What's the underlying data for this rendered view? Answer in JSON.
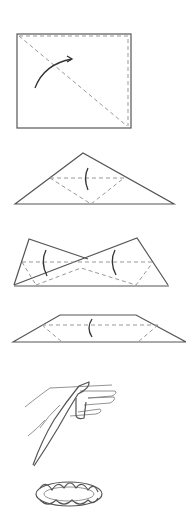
{
  "diagram": {
    "type": "folding-instructions",
    "steps": [
      {
        "index": 1,
        "name": "square-sheet",
        "description": "Square sheet with a diagonal fold line and an arrow showing the fold along it"
      },
      {
        "index": 2,
        "name": "triangle",
        "description": "Folded triangle with dashed fold lines and a curved arrow"
      },
      {
        "index": 3,
        "name": "crossed-folds",
        "description": "Corners folded inward and crossing, dashed fold lines, two curved arrows"
      },
      {
        "index": 4,
        "name": "trapezoid-band",
        "description": "Folded into a long band/trapezoid with dashed fold line and curved arrow"
      },
      {
        "index": 5,
        "name": "hand-wrap",
        "description": "Band being wrapped around the fingers of a hand"
      },
      {
        "index": 6,
        "name": "twisted-ring",
        "description": "Finished twisted ring shape"
      }
    ]
  },
  "colors": {
    "line": "#555555",
    "dashed": "#999999",
    "arrow": "#333333",
    "background": "#ffffff"
  }
}
